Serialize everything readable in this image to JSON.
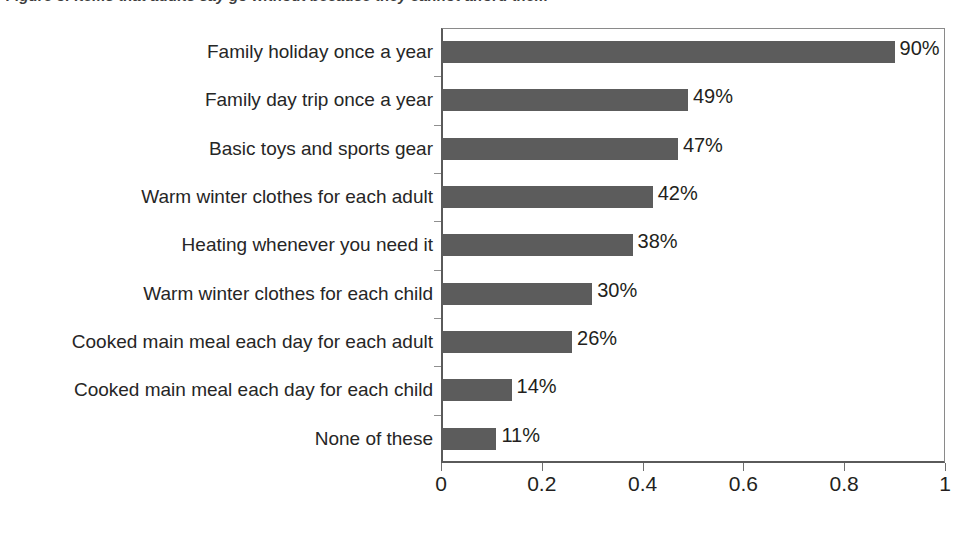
{
  "figure": {
    "title": "Figure 3: Items that adults say go without because they cannot afford them"
  },
  "chart_data": {
    "type": "bar",
    "orientation": "horizontal",
    "title": "",
    "xlabel": "",
    "ylabel": "",
    "xlim": [
      0,
      1
    ],
    "xticks": [
      "0",
      "0.2",
      "0.4",
      "0.6",
      "0.8",
      "1"
    ],
    "xtick_values": [
      0,
      0.2,
      0.4,
      0.6,
      0.8,
      1
    ],
    "grid": false,
    "legend": false,
    "bar_color": "#5c5c5c",
    "categories": [
      "Family holiday once a year",
      "Family day trip once a year",
      "Basic toys and sports gear",
      "Warm winter clothes for each adult",
      "Heating whenever you need it",
      "Warm winter clothes for each child",
      "Cooked main meal each day for each adult",
      "Cooked main meal each day for each child",
      "None of these"
    ],
    "values": [
      0.9,
      0.49,
      0.47,
      0.42,
      0.38,
      0.3,
      0.26,
      0.14,
      0.11
    ],
    "data_labels": [
      "90%",
      "49%",
      "47%",
      "42%",
      "38%",
      "30%",
      "26%",
      "14%",
      "11%"
    ]
  }
}
